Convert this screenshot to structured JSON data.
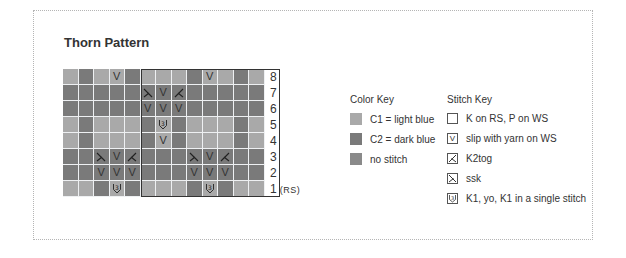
{
  "title": "Thorn Pattern",
  "colors": {
    "C1": "#a9a9a9",
    "C2": "#7a7a7a",
    "no_stitch": "#8a8a8a",
    "frame": "#333333",
    "grid_line": "#eef0f2"
  },
  "chart": {
    "columns": 13,
    "rows_top_to_bottom": [
      {
        "row": "8",
        "colors": [
          "L",
          "D",
          "L",
          "L",
          "D",
          "L",
          "L",
          "L",
          "D",
          "L",
          "L",
          "D",
          "L"
        ],
        "symbols": [
          "",
          "",
          "",
          "V",
          "",
          "",
          "",
          "",
          "",
          "V",
          "",
          "",
          ""
        ]
      },
      {
        "row": "7",
        "colors": [
          "D",
          "D",
          "D",
          "D",
          "D",
          "D",
          "D",
          "D",
          "D",
          "D",
          "D",
          "D",
          "D"
        ],
        "symbols": [
          "",
          "",
          "",
          "",
          "",
          "ssk",
          "V",
          "k2tog",
          "",
          "",
          "",
          "",
          ""
        ]
      },
      {
        "row": "6",
        "colors": [
          "D",
          "D",
          "D",
          "D",
          "D",
          "D",
          "D",
          "D",
          "D",
          "D",
          "D",
          "D",
          "D"
        ],
        "symbols": [
          "",
          "",
          "",
          "",
          "",
          "V",
          "V",
          "V",
          "",
          "",
          "",
          "",
          ""
        ]
      },
      {
        "row": "5",
        "colors": [
          "L",
          "D",
          "L",
          "L",
          "L",
          "D",
          "L",
          "D",
          "L",
          "L",
          "L",
          "D",
          "L"
        ],
        "symbols": [
          "",
          "",
          "",
          "",
          "",
          "",
          "3",
          "",
          "",
          "",
          "",
          "",
          ""
        ]
      },
      {
        "row": "4",
        "colors": [
          "L",
          "D",
          "L",
          "L",
          "L",
          "D",
          "L",
          "D",
          "L",
          "L",
          "L",
          "D",
          "L"
        ],
        "symbols": [
          "",
          "",
          "",
          "",
          "",
          "",
          "V",
          "",
          "",
          "",
          "",
          "",
          ""
        ]
      },
      {
        "row": "3",
        "colors": [
          "D",
          "D",
          "D",
          "D",
          "D",
          "D",
          "D",
          "D",
          "D",
          "D",
          "D",
          "D",
          "D"
        ],
        "symbols": [
          "",
          "",
          "ssk",
          "V",
          "k2tog",
          "",
          "",
          "",
          "ssk",
          "V",
          "k2tog",
          "",
          ""
        ]
      },
      {
        "row": "2",
        "colors": [
          "D",
          "D",
          "D",
          "D",
          "D",
          "D",
          "D",
          "D",
          "D",
          "D",
          "D",
          "D",
          "D"
        ],
        "symbols": [
          "",
          "",
          "V",
          "V",
          "V",
          "",
          "",
          "",
          "V",
          "V",
          "V",
          "",
          ""
        ]
      },
      {
        "row": "1",
        "colors": [
          "L",
          "L",
          "D",
          "L",
          "D",
          "L",
          "L",
          "L",
          "D",
          "L",
          "D",
          "L",
          "L"
        ],
        "symbols": [
          "",
          "",
          "",
          "3",
          "",
          "",
          "",
          "",
          "",
          "3",
          "",
          "",
          ""
        ]
      }
    ],
    "row_labels": [
      "8",
      "7",
      "6",
      "5",
      "4",
      "3",
      "2",
      "1"
    ],
    "rs_label": "(RS)",
    "repeat_frame": {
      "start_col": 6,
      "end_col": 14
    }
  },
  "color_key": {
    "heading": "Color Key",
    "items": [
      {
        "label": "C1 = light blue",
        "color": "#a9a9a9"
      },
      {
        "label": "C2 = dark blue",
        "color": "#7a7a7a"
      },
      {
        "label": "no stitch",
        "color": "#8a8a8a"
      }
    ]
  },
  "stitch_key": {
    "heading": "Stitch Key",
    "items": [
      {
        "symbol": "blank",
        "label": "K on RS, P on WS"
      },
      {
        "symbol": "V",
        "label": "slip with yarn on WS"
      },
      {
        "symbol": "k2tog",
        "label": "K2tog"
      },
      {
        "symbol": "ssk",
        "label": "ssk"
      },
      {
        "symbol": "3",
        "label": "K1, yo, K1 in a single stitch"
      }
    ]
  }
}
